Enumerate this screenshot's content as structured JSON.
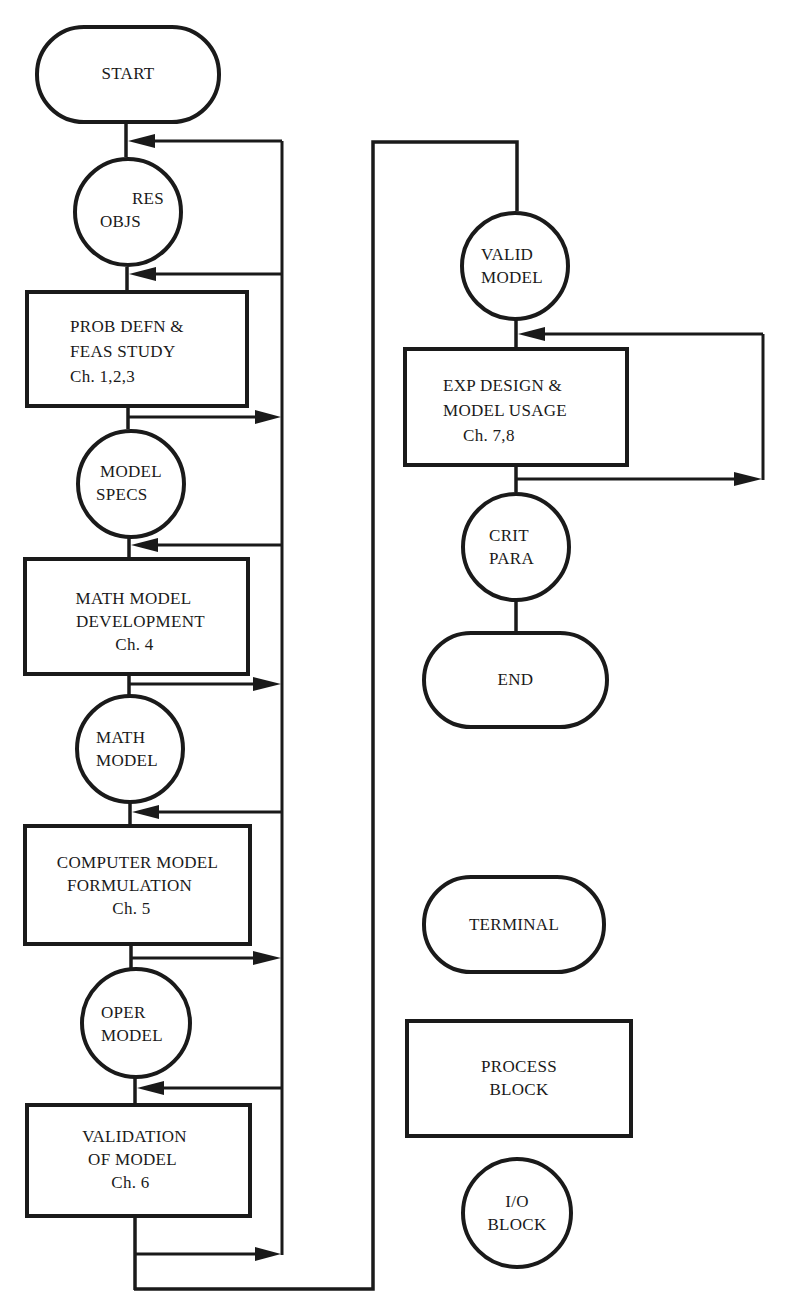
{
  "flowchart": {
    "main_flow": {
      "start": "START",
      "res_objs": [
        "RES",
        "OBJS"
      ],
      "prob_defn": [
        "PROB DEFN &",
        "FEAS STUDY",
        "Ch.  1,2,3"
      ],
      "model_specs": [
        "MODEL",
        "SPECS"
      ],
      "math_model_dev": [
        "MATH MODEL",
        "DEVELOPMENT",
        "Ch. 4"
      ],
      "math_model": [
        "MATH",
        "MODEL"
      ],
      "computer_model": [
        "COMPUTER MODEL",
        "FORMULATION",
        "Ch. 5"
      ],
      "oper_model": [
        "OPER",
        "MODEL"
      ],
      "validation": [
        "VALIDATION",
        "OF MODEL",
        "Ch. 6"
      ]
    },
    "second_flow": {
      "valid_model": [
        "VALID",
        "MODEL"
      ],
      "exp_design": [
        "EXP DESIGN &",
        "MODEL USAGE",
        "Ch. 7,8"
      ],
      "crit_para": [
        "CRIT",
        "PARA"
      ],
      "end": "END"
    },
    "legend": {
      "terminal": "TERMINAL",
      "process": [
        "PROCESS",
        "BLOCK"
      ],
      "io": [
        "I/O",
        "BLOCK"
      ]
    },
    "colors": {
      "ink": "#1a1a1a",
      "paper": "#ffffff"
    }
  }
}
